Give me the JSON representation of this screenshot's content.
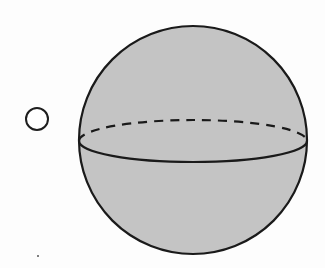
{
  "option": {
    "type": "radio",
    "selected": false
  },
  "figure": {
    "shape": "sphere",
    "fill_color": "#c4c4c4",
    "stroke_color": "#1a1a1a",
    "center": [
      193,
      140
    ],
    "radius": 114,
    "equator": {
      "cy": 141,
      "rx": 114,
      "ry": 21,
      "back_arc_style": "dashed",
      "front_arc_style": "solid"
    }
  },
  "colors": {
    "background": "#fdfdfd",
    "fill": "#c4c4c4",
    "stroke": "#1a1a1a"
  }
}
